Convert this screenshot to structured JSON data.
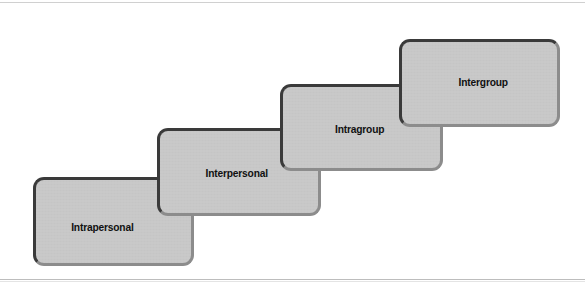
{
  "figure": {
    "type": "staircase-diagram",
    "orientation": "ascending-left-to-right",
    "background_color": "#ffffff",
    "rule_color": "#c9c9c9"
  },
  "style": {
    "box_fill": "#c9c9c9",
    "box_border_dark": "#3a3a3a",
    "box_border_light": "#8c8c8c",
    "label_color": "#111111"
  },
  "steps": [
    {
      "label": "Intrapersonal",
      "level": 1
    },
    {
      "label": "Interpersonal",
      "level": 2
    },
    {
      "label": "Intragroup",
      "level": 3
    },
    {
      "label": "Intergroup",
      "level": 4
    }
  ]
}
